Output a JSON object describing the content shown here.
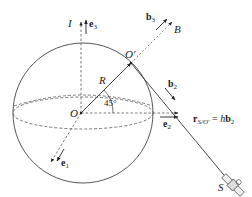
{
  "diagram": {
    "colors": {
      "stroke": "#333333",
      "dashed": "#555555",
      "background": "#ffffff"
    },
    "labels": {
      "inertial_frame": "I",
      "e3": "e",
      "e3_sub": "3",
      "e2": "e",
      "e2_sub": "2",
      "e1": "e",
      "e1_sub": "1",
      "body_frame": "B",
      "b3": "b",
      "b3_sub": "3",
      "b2": "b",
      "b2_sub": "2",
      "origin": "O",
      "origin_prime": "O′",
      "radius": "R",
      "angle": "45°",
      "spacecraft": "S",
      "position_vector": "r",
      "position_vector_sub": "S/O′",
      "equation_rhs": " = ",
      "equation_h": "h",
      "equation_b": "b",
      "equation_b_sub": "2"
    }
  }
}
